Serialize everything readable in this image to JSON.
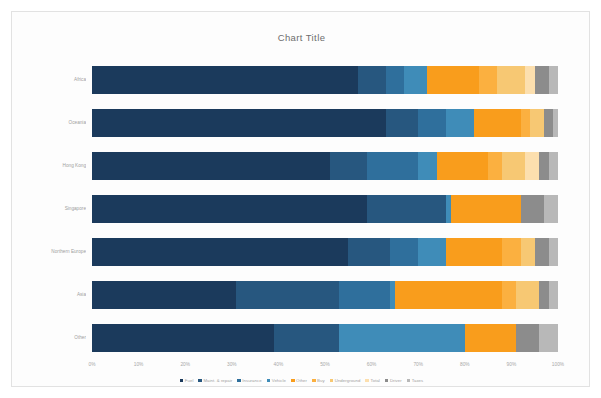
{
  "chart_data": {
    "type": "bar",
    "subtype": "stacked-horizontal-100-percent",
    "title": "Chart Title",
    "xlabel": "",
    "ylabel": "",
    "xlim": [
      0,
      100
    ],
    "xticks": [
      "0%",
      "10%",
      "20%",
      "30%",
      "40%",
      "50%",
      "60%",
      "70%",
      "80%",
      "90%",
      "100%"
    ],
    "xtick_values": [
      0,
      10,
      20,
      30,
      40,
      50,
      60,
      70,
      80,
      90,
      100
    ],
    "grid": false,
    "legend_position": "bottom",
    "categories": [
      "Africa",
      "Oceania",
      "Hong Kong",
      "Singapore",
      "Northern Europe",
      "Asia",
      "Other"
    ],
    "series": [
      {
        "name": "Fuel",
        "color": "#1b3a5c",
        "values": [
          57.0,
          63.0,
          51.0,
          59.0,
          55.0,
          31.0,
          39.0
        ]
      },
      {
        "name": "Maintenance & repair",
        "color": "#27577f",
        "values": [
          6.0,
          7.0,
          8.0,
          17.0,
          9.0,
          22.0,
          14.0
        ]
      },
      {
        "name": "Insurance",
        "color": "#2f6f9c",
        "values": [
          4.0,
          6.0,
          11.0,
          0.0,
          6.0,
          11.0,
          0.0
        ]
      },
      {
        "name": "Vehicle",
        "color": "#3f8cb8",
        "values": [
          5.0,
          6.0,
          4.0,
          1.0,
          6.0,
          1.0,
          27.0
        ]
      },
      {
        "name": "Other",
        "color": "#f99d1c",
        "values": [
          11.0,
          10.0,
          11.0,
          15.0,
          12.0,
          23.0,
          11.0
        ]
      },
      {
        "name": "Buy",
        "color": "#fbb040",
        "values": [
          4.0,
          2.0,
          3.0,
          0.0,
          4.0,
          3.0,
          0.0
        ]
      },
      {
        "name": "Underground",
        "color": "#f7c873",
        "values": [
          6.0,
          3.0,
          5.0,
          0.0,
          3.0,
          5.0,
          0.0
        ]
      },
      {
        "name": "Total",
        "color": "#fcdfae",
        "values": [
          2.0,
          0.0,
          3.0,
          0.0,
          0.0,
          0.0,
          0.0
        ]
      },
      {
        "name": "Driver",
        "color": "#8c8c8c",
        "values": [
          3.0,
          2.0,
          2.0,
          5.0,
          3.0,
          2.0,
          5.0
        ]
      },
      {
        "name": "Taxes",
        "color": "#b8b8b8",
        "values": [
          2.0,
          1.0,
          2.0,
          3.0,
          2.0,
          2.0,
          4.0
        ]
      }
    ]
  },
  "legend": {
    "items": [
      {
        "label": "Fuel",
        "color": "#1b3a5c"
      },
      {
        "label": "Maint. & repair",
        "color": "#27577f"
      },
      {
        "label": "Insurance",
        "color": "#2f6f9c"
      },
      {
        "label": "Vehicle",
        "color": "#3f8cb8"
      },
      {
        "label": "Other",
        "color": "#f99d1c"
      },
      {
        "label": "Buy",
        "color": "#fbb040"
      },
      {
        "label": "Underground",
        "color": "#f7c873"
      },
      {
        "label": "Total",
        "color": "#fcdfae"
      },
      {
        "label": "Driver",
        "color": "#8c8c8c"
      },
      {
        "label": "Taxes",
        "color": "#b8b8b8"
      }
    ]
  }
}
